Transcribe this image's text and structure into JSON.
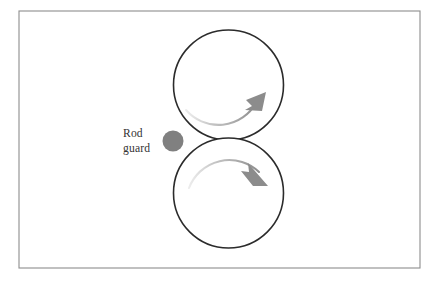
{
  "figure": {
    "canvas": {
      "width": 440,
      "height": 287,
      "background": "#ffffff"
    },
    "frame": {
      "x": 19,
      "y": 11,
      "width": 401,
      "height": 257,
      "stroke_color": "#8d8d8d",
      "fill_color": "#ffffff"
    },
    "label": {
      "line1": "Rod",
      "line2": "guard",
      "color": "#333333",
      "x": 123,
      "y1": 137,
      "y2": 152
    },
    "rod_guard": {
      "name": "rod guard",
      "cx": 173,
      "cy": 141,
      "r": 10.5,
      "color": "#808080"
    },
    "rollers": [
      {
        "name": "upper roller",
        "cx": 228.5,
        "cy": 85,
        "r": 55,
        "stroke_color": "#2b2b2b",
        "fill_color": "#ffffff",
        "rotation": "clockwise",
        "arrow": {
          "color": "#8c8c8c",
          "arc_path": "M 186 112 A 40 40 0 0 0 258 101",
          "head_points": "258,100 246,104 252,112",
          "head_tip_x": 264,
          "head_tip_y": 92
        }
      },
      {
        "name": "lower roller",
        "cx": 228.5,
        "cy": 193,
        "r": 55,
        "stroke_color": "#2b2b2b",
        "fill_color": "#ffffff",
        "rotation": "clockwise",
        "arrow": {
          "color": "#8c8c8c",
          "arc_path": "M 191 187 A 40 40 0 0 1 261 174",
          "head_points": "261,174 250,171 254,163",
          "head_tip_x": 266,
          "head_tip_y": 186
        }
      }
    ]
  }
}
